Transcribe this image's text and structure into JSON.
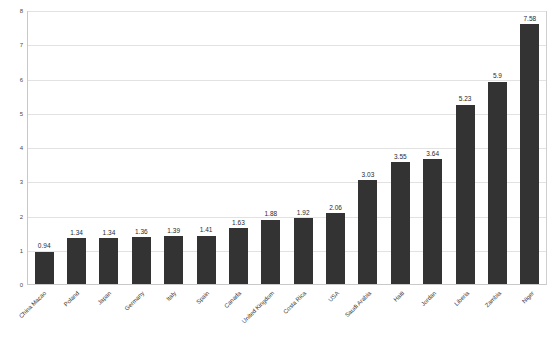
{
  "chart_data": {
    "type": "bar",
    "title": "",
    "subtitle": "",
    "xlabel": "",
    "ylabel": "",
    "ylim": [
      0,
      8
    ],
    "yticks": [
      0,
      1,
      2,
      3,
      4,
      5,
      6,
      7,
      8
    ],
    "ytick_labels": [
      "0",
      "1",
      "2",
      "3",
      "4",
      "5",
      "6",
      "7",
      "8"
    ],
    "grid": true,
    "legend": null,
    "bar_color": "#333333",
    "gridline_color": "#e2e2e2",
    "axis_color": "#c9c9c9",
    "categories": [
      "China Macao",
      "Poland",
      "Japan",
      "Germany",
      "Italy",
      "Spain",
      "Canada",
      "United Kingdom",
      "Costa Rica",
      "USA",
      "Saudi Arabia",
      "Haiti",
      "Jordan",
      "Liberia",
      "Zambia",
      "Niger"
    ],
    "values": [
      0.94,
      1.34,
      1.34,
      1.36,
      1.39,
      1.41,
      1.63,
      1.88,
      1.92,
      2.06,
      3.03,
      3.55,
      3.64,
      5.23,
      5.9,
      7.58
    ],
    "data_labels": [
      "0.94",
      "1.34",
      "1.34",
      "1.36",
      "1.39",
      "1.41",
      "1.63",
      "1.88",
      "1.92",
      "2.06",
      "3.03",
      "3.55",
      "3.64",
      "5.23",
      "5.9",
      "7.58"
    ]
  }
}
